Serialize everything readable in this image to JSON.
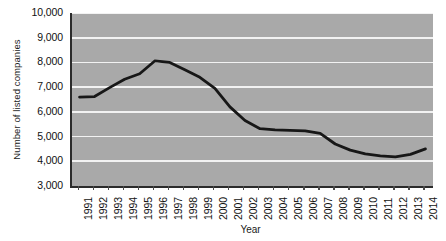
{
  "chart_data": {
    "type": "line",
    "title": "",
    "xlabel": "Year",
    "ylabel": "Number of listed companies",
    "grid": true,
    "legend": false,
    "xlim": [
      1991,
      2014
    ],
    "ylim": [
      3000,
      10000
    ],
    "ytick_labels": [
      "10,000",
      "9,000",
      "8,000",
      "7,000",
      "6,000",
      "5,000",
      "4,000",
      "3,000"
    ],
    "ytick_values": [
      10000,
      9000,
      8000,
      7000,
      6000,
      5000,
      4000,
      3000
    ],
    "categories": [
      "1991",
      "1992",
      "1993",
      "1994",
      "1995",
      "1996",
      "1997",
      "1998",
      "1999",
      "2000",
      "2001",
      "2002",
      "2003",
      "2004",
      "2005",
      "2006",
      "2007",
      "2008",
      "2009",
      "2010",
      "2011",
      "2012",
      "2013",
      "2014"
    ],
    "series": [
      {
        "name": "Number of listed companies",
        "color": "#171717",
        "values": [
          6600,
          6620,
          6980,
          7320,
          7540,
          8060,
          8000,
          7700,
          7400,
          6950,
          6200,
          5650,
          5320,
          5270,
          5250,
          5230,
          5130,
          4700,
          4450,
          4300,
          4220,
          4180,
          4280,
          4500
        ]
      }
    ]
  },
  "colors": {
    "plot_background": "#a9a9a9",
    "gridline": "#f2f2f2",
    "axis": "#2b2b2b",
    "line": "#171717",
    "text": "#111111",
    "page_background": "#ffffff"
  }
}
